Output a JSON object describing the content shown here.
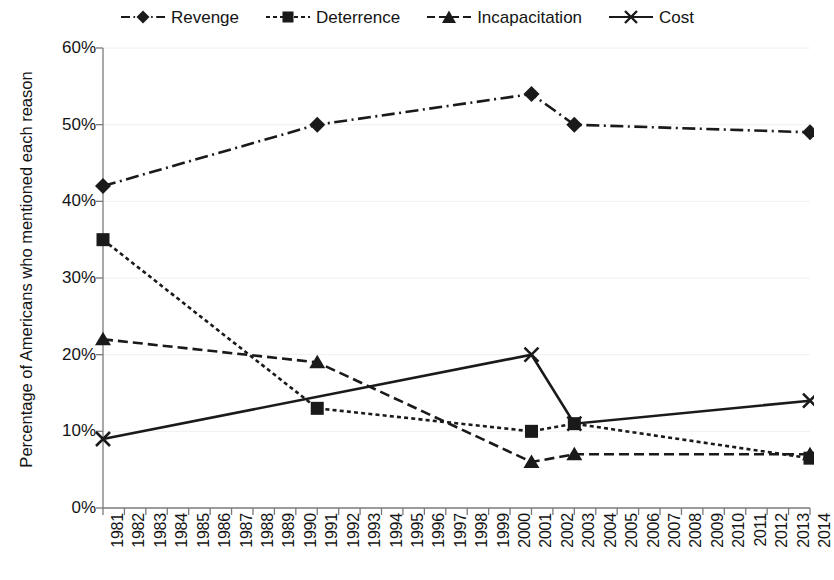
{
  "chart_data": {
    "type": "line",
    "title": "",
    "xlabel": "",
    "ylabel": "Percentage of Americans who mentioned each reason",
    "ylim": [
      0,
      60
    ],
    "ytick_labels": [
      "0%",
      "10%",
      "20%",
      "30%",
      "40%",
      "50%",
      "60%"
    ],
    "ytick_values": [
      0,
      10,
      20,
      30,
      40,
      50,
      60
    ],
    "grid": "horizontal-faint",
    "legend_position": "top-center",
    "categories": [
      "1981",
      "1982",
      "1983",
      "1984",
      "1985",
      "1986",
      "1987",
      "1988",
      "1989",
      "1990",
      "1991",
      "1992",
      "1993",
      "1994",
      "1995",
      "1996",
      "1997",
      "1998",
      "1999",
      "2000",
      "2001",
      "2002",
      "2003",
      "2004",
      "2005",
      "2006",
      "2007",
      "2008",
      "2009",
      "2010",
      "2011",
      "2012",
      "2013",
      "2014"
    ],
    "series": [
      {
        "name": "Revenge",
        "marker": "diamond",
        "dash": "dashdot",
        "color": "#1a1a1a",
        "points": [
          {
            "x": "1981",
            "y": 42
          },
          {
            "x": "1991",
            "y": 50
          },
          {
            "x": "2001",
            "y": 54
          },
          {
            "x": "2003",
            "y": 50
          },
          {
            "x": "2014",
            "y": 49
          }
        ]
      },
      {
        "name": "Deterrence",
        "marker": "square",
        "dash": "dotted",
        "color": "#1a1a1a",
        "points": [
          {
            "x": "1981",
            "y": 35
          },
          {
            "x": "1991",
            "y": 13
          },
          {
            "x": "2001",
            "y": 10
          },
          {
            "x": "2003",
            "y": 11
          },
          {
            "x": "2014",
            "y": 6.5
          }
        ]
      },
      {
        "name": "Incapacitation",
        "marker": "triangle",
        "dash": "dashed",
        "color": "#1a1a1a",
        "points": [
          {
            "x": "1981",
            "y": 22
          },
          {
            "x": "1991",
            "y": 19
          },
          {
            "x": "2001",
            "y": 6
          },
          {
            "x": "2003",
            "y": 7
          },
          {
            "x": "2014",
            "y": 7
          }
        ]
      },
      {
        "name": "Cost",
        "marker": "x",
        "dash": "solid",
        "color": "#1a1a1a",
        "points": [
          {
            "x": "1981",
            "y": 9
          },
          {
            "x": "2001",
            "y": 20
          },
          {
            "x": "2003",
            "y": 11
          },
          {
            "x": "2014",
            "y": 14
          }
        ]
      }
    ]
  },
  "legend": {
    "items": [
      {
        "label": "Revenge"
      },
      {
        "label": "Deterrence"
      },
      {
        "label": "Incapacitation"
      },
      {
        "label": "Cost"
      }
    ]
  }
}
